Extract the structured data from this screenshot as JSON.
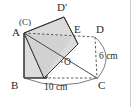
{
  "figure": {
    "background_color": "#ffffff",
    "stroke_color": "#3a3a3a",
    "fill_color": "#dcdcdc",
    "right_rule_color": "#cccccc",
    "labels": {
      "a": "A",
      "b": "B",
      "c": "C",
      "d": "D",
      "e": "E",
      "d_prime": "D′",
      "c_paren": "(C)",
      "o": "O"
    },
    "dimensions": {
      "base": "10 cm",
      "height": "6 cm"
    },
    "vertices": {
      "A": [
        24,
        33
      ],
      "B": [
        24,
        78
      ],
      "C": [
        97,
        78
      ],
      "D": [
        95,
        37
      ],
      "E": [
        72,
        37
      ],
      "D_prime": [
        64,
        17
      ],
      "O": [
        62,
        62
      ],
      "square_br": [
        47,
        78
      ]
    }
  }
}
